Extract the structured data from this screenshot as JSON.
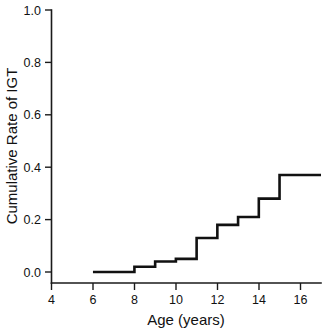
{
  "chart_data": {
    "type": "line",
    "subtype": "step",
    "title": "",
    "xlabel": "Age (years)",
    "ylabel": "Cumulative Rate of IGT",
    "xlim": [
      4,
      17
    ],
    "ylim": [
      0.0,
      1.0
    ],
    "grid": false,
    "legend": null,
    "xticks": [
      4,
      6,
      8,
      10,
      12,
      14,
      16
    ],
    "xtick_labels": [
      "4",
      "6",
      "8",
      "10",
      "12",
      "14",
      "16"
    ],
    "yticks": [
      0.0,
      0.2,
      0.4,
      0.6,
      0.8,
      1.0
    ],
    "ytick_labels": [
      "0.0",
      "0.2",
      "0.4",
      "0.6",
      "0.8",
      "1.0"
    ],
    "series": [
      {
        "name": "Cumulative Rate of IGT",
        "color": "#111111",
        "x": [
          6,
          8,
          9,
          10,
          11,
          12,
          13,
          14,
          15,
          17
        ],
        "y": [
          0.0,
          0.02,
          0.04,
          0.05,
          0.13,
          0.18,
          0.21,
          0.28,
          0.37,
          0.37
        ]
      }
    ]
  }
}
